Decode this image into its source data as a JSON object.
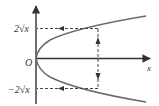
{
  "diagram": {
    "axes": {
      "x_label": "x",
      "origin_label": "O"
    },
    "labels": {
      "upper_branch": "2√x",
      "lower_branch": "−2√x"
    },
    "colors": {
      "curve": "#6b6b6b",
      "axis": "#333333",
      "dashed": "#444444",
      "background": "#ffffff"
    }
  }
}
